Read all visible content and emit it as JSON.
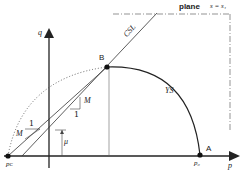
{
  "diagram": {
    "type": "critical state yield surface in p-q space",
    "axes": {
      "x_label": "p",
      "y_label": "q"
    },
    "labels": {
      "plane": "plane",
      "plane_eq": "s = s₁",
      "csl": "CSL",
      "ys": "YS",
      "point_b": "B",
      "point_a": "A",
      "pc": "pᴄ",
      "p0": "p₀",
      "slope_m": "M",
      "slope_one": "1",
      "slope_m2": "M",
      "slope_one2": "1",
      "mu": "μ"
    },
    "colors": {
      "line": "#222222",
      "thin": "#555555",
      "background": "#ffffff"
    }
  }
}
